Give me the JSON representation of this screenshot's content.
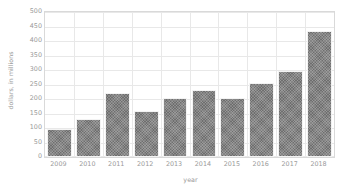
{
  "chart_data": {
    "type": "bar",
    "title": "",
    "xlabel": "year",
    "ylabel": "dollars, in millions",
    "categories": [
      "2009",
      "2010",
      "2011",
      "2012",
      "2013",
      "2014",
      "2015",
      "2016",
      "2017",
      "2018"
    ],
    "values": [
      95,
      130,
      220,
      158,
      205,
      232,
      205,
      255,
      295,
      435
    ],
    "ylim": [
      0,
      500
    ],
    "ytick_values": [
      0,
      50,
      100,
      150,
      200,
      250,
      300,
      350,
      400,
      450,
      500
    ],
    "ytick_labels": [
      "0",
      "50",
      "100",
      "150",
      "200",
      "250",
      "300",
      "350",
      "400",
      "450",
      "500"
    ],
    "grid": true,
    "legend": "none",
    "series": [
      {
        "name": "dollars, in millions",
        "values": [
          95,
          130,
          220,
          158,
          205,
          232,
          205,
          255,
          295,
          435
        ]
      }
    ],
    "colors": {
      "bar_fill": "#6e6e6e",
      "bar_edge": "#f3f3f3",
      "gridline": "#e8e8e8",
      "axis_border": "#d9d9d9",
      "tick_text": "#9a9a9a",
      "background": "#ffffff"
    }
  }
}
